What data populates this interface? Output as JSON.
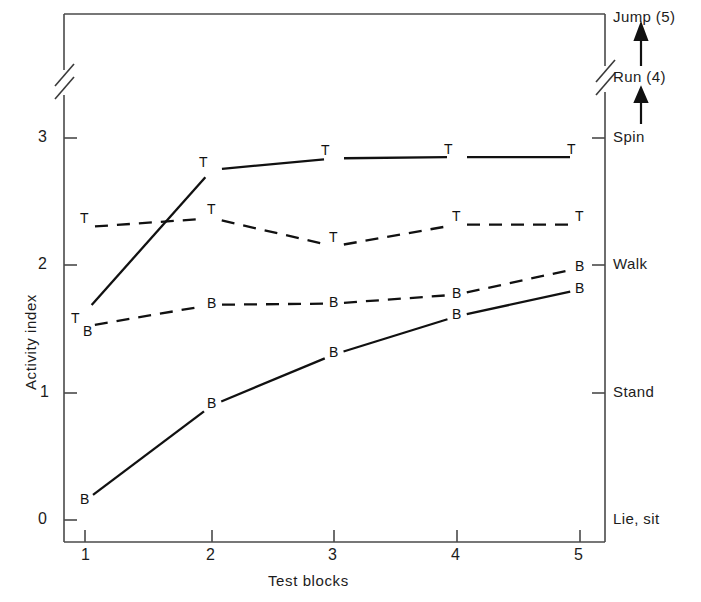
{
  "chart_data": {
    "type": "line",
    "title": "",
    "xlabel": "Test blocks",
    "ylabel": "Activity index",
    "x": [
      1,
      2,
      3,
      4,
      5
    ],
    "xtick_labels": [
      "1",
      "2",
      "3",
      "4",
      "5"
    ],
    "ytick_labels": [
      "0",
      "1",
      "2",
      "3"
    ],
    "ytick_values": [
      0,
      1,
      2,
      3
    ],
    "ylim": [
      0,
      3.45
    ],
    "xlim": [
      0.5,
      5.5
    ],
    "grid": false,
    "legend_position": "none",
    "axis_break": {
      "present": true,
      "axes": [
        "left",
        "right"
      ],
      "note": "double-slash break above the value 3"
    },
    "series": [
      {
        "name": "T solid",
        "marker_letter": "T",
        "linestyle": "solid",
        "values": [
          1.63,
          2.75,
          2.84,
          2.85,
          2.85
        ]
      },
      {
        "name": "T dashed",
        "marker_letter": "T",
        "linestyle": "dashed",
        "values": [
          2.3,
          2.37,
          2.15,
          2.32,
          2.32
        ]
      },
      {
        "name": "B dashed",
        "marker_letter": "B",
        "linestyle": "dashed",
        "values": [
          1.52,
          1.69,
          1.7,
          1.77,
          1.98
        ]
      },
      {
        "name": "B solid",
        "marker_letter": "B",
        "linestyle": "solid",
        "values": [
          0.15,
          0.9,
          1.3,
          1.6,
          1.81
        ]
      }
    ],
    "right_axis": {
      "label": "",
      "ticks": [
        {
          "label": "Lie, sit",
          "value": 0,
          "tick_mark": false
        },
        {
          "label": "Stand",
          "value": 1,
          "tick_mark": true
        },
        {
          "label": "Walk",
          "value": 2,
          "tick_mark": true
        },
        {
          "label": "Spin",
          "value": 3,
          "tick_mark": true
        },
        {
          "label": "Run (4)",
          "value": 4,
          "tick_mark": false,
          "above_break": true
        },
        {
          "label": "Jump (5)",
          "value": 5,
          "tick_mark": false,
          "above_break": true
        }
      ],
      "arrows": [
        {
          "from": "Spin",
          "to": "Run (4)"
        },
        {
          "from": "Run (4)",
          "to": "Jump (5)"
        }
      ]
    },
    "colors": {
      "axis": "#4a4a4a",
      "line": "#111111",
      "text": "#1c1c1c"
    }
  }
}
